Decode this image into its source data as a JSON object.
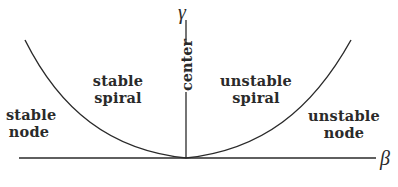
{
  "diagram": {
    "axes": {
      "horizontal": {
        "symbol": "β"
      },
      "vertical": {
        "symbol": "γ"
      }
    },
    "regions": [
      {
        "id": "stable-node",
        "line1": "stable",
        "line2": "node"
      },
      {
        "id": "stable-spiral",
        "line1": "stable",
        "line2": "spiral"
      },
      {
        "id": "center",
        "label": "center"
      },
      {
        "id": "unstable-spiral",
        "line1": "unstable",
        "line2": "spiral"
      },
      {
        "id": "unstable-node",
        "line1": "unstable",
        "line2": "node"
      }
    ],
    "curve": {
      "type": "parabola",
      "description": "γ² = 4β-type boundary separating node and spiral regions"
    },
    "colors": {
      "ink": "#2a2a2a",
      "background": "#ffffff"
    }
  }
}
